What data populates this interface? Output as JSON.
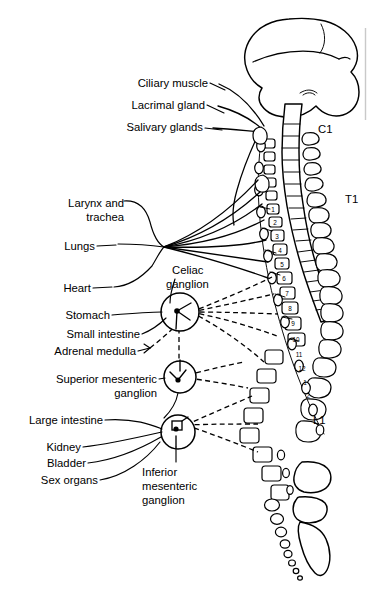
{
  "figure": {
    "background_color": "#ffffff",
    "ink_color": "#000000",
    "edge_rule_color": "#c9c9c9",
    "width": 372,
    "height": 593
  },
  "labels": {
    "ciliary_muscle": "Ciliary muscle",
    "lacrimal_gland": "Lacrimal gland",
    "salivary_glands": "Salivary glands",
    "larynx_line1": "Larynx and",
    "larynx_line2": "trachea",
    "lungs": "Lungs",
    "heart": "Heart",
    "stomach": "Stomach",
    "small_intestine": "Small intestine",
    "adrenal_medulla": "Adrenal medulla",
    "large_intestine": "Large intestine",
    "kidney": "Kidney",
    "bladder": "Bladder",
    "sex_organs": "Sex organs"
  },
  "ganglia": {
    "celiac_line1": "Celiac",
    "celiac_line2": "ganglion",
    "superior_mesenteric_line1": "Superior mesenteric",
    "superior_mesenteric_line2": "ganglion",
    "inferior_mesenteric_line1": "Inferior",
    "inferior_mesenteric_line2": "mesenteric",
    "inferior_mesenteric_line3": "ganglion"
  },
  "spine_levels": {
    "cervical_first": "C1",
    "thoracic_first": "T1",
    "lumbar_first": "L1"
  },
  "segment_numbers": [
    "1",
    "2",
    "3",
    "4",
    "5",
    "6",
    "7",
    "8",
    "9",
    "10",
    "11",
    "12",
    "1",
    "2"
  ],
  "anatomy_parts": {
    "brain": "brain",
    "cerebellum": "cerebellum",
    "brainstem": "brainstem",
    "spinal_cord": "spinal-cord",
    "vertebral_column": "vertebral-column",
    "sacrum": "sacrum",
    "coccyx": "coccyx",
    "sympathetic_chain": "sympathetic-chain"
  }
}
